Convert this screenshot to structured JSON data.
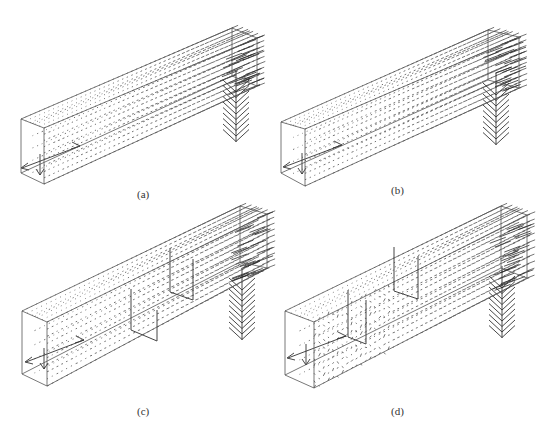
{
  "figure": {
    "colors": {
      "frame": "#555555",
      "vector": "#3a3a3a",
      "background": "#ffffff"
    },
    "panels": [
      {
        "id": "a",
        "label": "(a)",
        "label_pos": [
          137,
          196
        ],
        "box": {
          "fl_top": [
            21,
            119
          ],
          "fl_bot": [
            21,
            173
          ],
          "fr_top": [
            44,
            128
          ],
          "fr_bot": [
            44,
            184
          ],
          "bl_top": [
            232,
            28
          ],
          "br_top": [
            257,
            38
          ],
          "br_bot": [
            257,
            86
          ],
          "bl_bot": [
            232,
            76
          ]
        },
        "baffles": [],
        "outlet_tip": [
          236,
          140
        ],
        "inlet": [
          62,
          158
        ]
      },
      {
        "id": "b",
        "label": "(b)",
        "label_pos": [
          391,
          193
        ],
        "box": {
          "fl_top": [
            281,
            122
          ],
          "fl_bot": [
            281,
            173
          ],
          "fr_top": [
            305,
            129
          ],
          "fr_bot": [
            305,
            186
          ],
          "bl_top": [
            488,
            30
          ],
          "br_top": [
            519,
            37
          ],
          "br_bot": [
            519,
            88
          ],
          "bl_bot": [
            488,
            80
          ]
        },
        "baffles": [],
        "outlet_tip": [
          496,
          143
        ],
        "inlet": [
          324,
          157
        ]
      },
      {
        "id": "c",
        "label": "(c)",
        "label_pos": [
          137,
          414
        ],
        "box": {
          "fl_top": [
            22,
            311
          ],
          "fl_bot": [
            22,
            374
          ],
          "fr_top": [
            47,
            322
          ],
          "fr_bot": [
            47,
            386
          ],
          "bl_top": [
            240,
            206
          ],
          "br_top": [
            267,
            214
          ],
          "br_bot": [
            267,
            268
          ],
          "bl_bot": [
            240,
            262
          ]
        },
        "baffles": [
          {
            "pts": [
              [
                131,
                289
              ],
              [
                131,
                330
              ],
              [
                157,
                341
              ],
              [
                157,
                310
              ]
            ]
          },
          {
            "pts": [
              [
                170,
                248
              ],
              [
                170,
                292
              ],
              [
                193,
                300
              ],
              [
                193,
                259
              ]
            ]
          }
        ],
        "outlet_tip": [
          242,
          338
        ],
        "inlet": [
          66,
          352
        ]
      },
      {
        "id": "d",
        "label": "(d)",
        "label_pos": [
          391,
          414
        ],
        "box": {
          "fl_top": [
            285,
            311
          ],
          "fl_bot": [
            285,
            375
          ],
          "fr_top": [
            314,
            322
          ],
          "fr_bot": [
            314,
            388
          ],
          "bl_top": [
            501,
            206
          ],
          "br_top": [
            527,
            215
          ],
          "br_bot": [
            527,
            278
          ],
          "bl_bot": [
            501,
            268
          ]
        },
        "baffles": [
          {
            "pts": [
              [
                348,
                290
              ],
              [
                348,
                337
              ],
              [
                366,
                344
              ],
              [
                366,
                300
              ]
            ]
          },
          {
            "pts": [
              [
                394,
                247
              ],
              [
                394,
                291
              ],
              [
                418,
                299
              ],
              [
                418,
                256
              ]
            ]
          }
        ],
        "outlet_tip": [
          502,
          336
        ],
        "inlet": [
          328,
          348
        ]
      }
    ]
  }
}
